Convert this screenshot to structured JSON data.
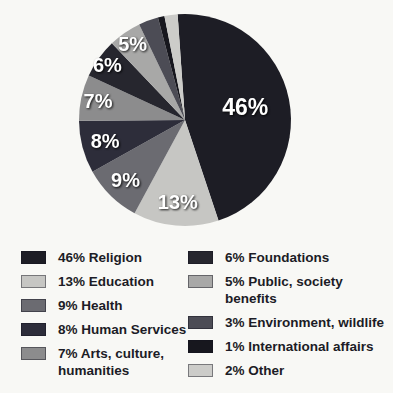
{
  "page": {
    "background_color": "#f8f8f5",
    "title": ""
  },
  "chart_data": {
    "type": "pie",
    "title": "",
    "legend_position": "bottom",
    "direction": "clockwise",
    "start_angle_deg": -4,
    "pie": {
      "cx": 185,
      "cy": 120,
      "r": 106
    },
    "slices": [
      {
        "name": "religion",
        "legend_text": "46% Religion",
        "pct_text": "46%",
        "value": 46,
        "color": "#1d1d25",
        "label_r": 0.58
      },
      {
        "name": "education",
        "legend_text": "13% Education",
        "pct_text": "13%",
        "value": 13,
        "color": "#c6c6c3",
        "label_r": 0.78
      },
      {
        "name": "health",
        "legend_text": "9% Health",
        "pct_text": "9%",
        "value": 9,
        "color": "#6b6b71",
        "label_r": 0.8
      },
      {
        "name": "human-services",
        "legend_text": "8% Human Services",
        "pct_text": "8%",
        "value": 8,
        "color": "#2d2d3a",
        "label_r": 0.78
      },
      {
        "name": "arts-culture-humanities",
        "legend_text": "7% Arts, culture, humanities",
        "pct_text": "7%",
        "value": 7,
        "color": "#8c8c8d",
        "label_r": 0.84
      },
      {
        "name": "foundations",
        "legend_text": "6% Foundations",
        "pct_text": "6%",
        "value": 6,
        "color": "#26262e",
        "label_r": 0.9
      },
      {
        "name": "public-society-benefits",
        "legend_text": "5% Public, society benefits",
        "pct_text": "5%",
        "value": 5,
        "color": "#a8a8a7",
        "label_r": 0.87
      },
      {
        "name": "environment-wildlife",
        "legend_text": "3% Environment, wildlife",
        "pct_text": "3%",
        "value": 3,
        "color": "#4c4c55",
        "label_r": null
      },
      {
        "name": "international-affairs",
        "legend_text": "1% International affairs",
        "pct_text": "1%",
        "value": 1,
        "color": "#17171e",
        "label_r": null
      },
      {
        "name": "other",
        "legend_text": "2% Other",
        "pct_text": "2%",
        "value": 2,
        "color": "#ccccc9",
        "label_r": null
      }
    ],
    "legend_columns": [
      [
        0,
        1,
        2,
        3,
        4
      ],
      [
        5,
        6,
        7,
        8,
        9
      ]
    ]
  }
}
